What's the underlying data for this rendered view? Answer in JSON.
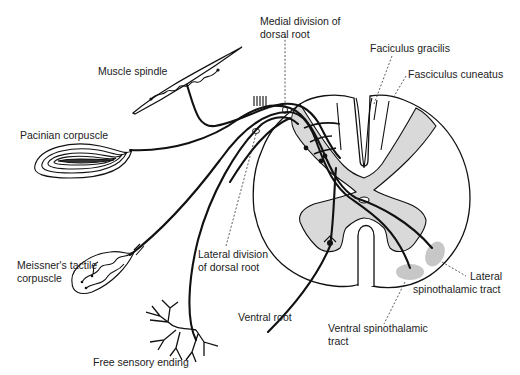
{
  "diagram": {
    "labels": {
      "medial_division_line1": "Medial division of",
      "medial_division_line2": "dorsal root",
      "fasciculus_gracilis": "Faciculus gracilis",
      "fasciculus_cuneatus": "Fasciculus cuneatus",
      "muscle_spindle": "Muscle spindle",
      "pacinian_corpuscle": "Pacinian corpuscle",
      "meissner_line1": "Meissner's tactile",
      "meissner_line2": "corpuscle",
      "lateral_division_line1": "Lateral division",
      "lateral_division_line2": "of dorsal root",
      "ventral_root": "Ventral root",
      "free_sensory_ending": "Free sensory ending",
      "lateral_spinothalamic_line1": "Lateral",
      "lateral_spinothalamic_line2": "spinothalamic tract",
      "ventral_spinothalamic_line1": "Ventral spinothalamic",
      "ventral_spinothalamic_line2": "tract"
    },
    "colors": {
      "ink": "#111111",
      "grey_matter": "#d9d9d9",
      "tract_shading": "#bdbdbd",
      "background": "#ffffff"
    }
  }
}
